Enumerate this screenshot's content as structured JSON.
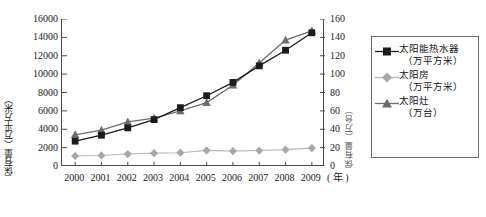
{
  "chart_data": {
    "type": "line",
    "title": "",
    "subtitle": "",
    "xlabel": "年",
    "ylabel": "保有量（万平方米）",
    "y2label": "保有量（万台）",
    "grid": false,
    "legend_position": "right",
    "categories": [
      "2000",
      "2001",
      "2002",
      "2003",
      "2004",
      "2005",
      "2006",
      "2007",
      "2008",
      "2009"
    ],
    "x": [
      2000,
      2001,
      2002,
      2003,
      2004,
      2005,
      2006,
      2007,
      2008,
      2009
    ],
    "ylim": [
      0,
      16000
    ],
    "yticks": [
      0,
      2000,
      4000,
      6000,
      8000,
      10000,
      12000,
      14000,
      16000
    ],
    "y2lim": [
      0,
      160
    ],
    "y2ticks": [
      0,
      20,
      40,
      60,
      80,
      100,
      120,
      140,
      160
    ],
    "series": [
      {
        "name": "太阳能热水器（万平方米）",
        "name_line1": "太阳能热水器",
        "name_line2": "（万平方米）",
        "axis": "left",
        "marker": "square",
        "color": "#1b1b1b",
        "values": [
          2700,
          3350,
          4150,
          5050,
          6350,
          7650,
          9100,
          10900,
          12600,
          14500
        ]
      },
      {
        "name": "太阳房（万平方米）",
        "name_line1": "太阳房",
        "name_line2": "（万平方米）",
        "axis": "left",
        "marker": "diamond",
        "color": "#a8a8a8",
        "values": [
          1100,
          1150,
          1300,
          1400,
          1450,
          1700,
          1620,
          1680,
          1780,
          1950
        ]
      },
      {
        "name": "太阳灶（万台）",
        "name_line1": "太阳灶",
        "name_line2": "（万台）",
        "axis": "right",
        "marker": "triangle",
        "color": "#6d6d6d",
        "values": [
          34,
          39,
          48,
          52,
          60,
          69,
          88,
          112,
          137,
          147
        ]
      }
    ]
  },
  "axes": {
    "left_title": "保有量（万平方米）",
    "right_title": "保有量（万台）",
    "x_unit": "( 年 )",
    "left_ticks": [
      "16000",
      "14000",
      "12000",
      "10000",
      "8000",
      "6000",
      "4000",
      "2000",
      "0"
    ],
    "right_ticks": [
      "160",
      "140",
      "120",
      "100",
      "80",
      "60",
      "40",
      "20",
      "0"
    ],
    "x_ticks": [
      "2000",
      "2001",
      "2002",
      "2003",
      "2004",
      "2005",
      "2006",
      "2007",
      "2008",
      "2009"
    ]
  },
  "legend": {
    "entries": [
      {
        "line1": "太阳能热水器",
        "line2": "（万平方米）",
        "marker": "square-marker-icon",
        "color": "#1b1b1b"
      },
      {
        "line1": "太阳房",
        "line2": "（万平方米）",
        "marker": "diamond-marker-icon",
        "color": "#a8a8a8"
      },
      {
        "line1": "太阳灶",
        "line2": "（万台）",
        "marker": "triangle-marker-icon",
        "color": "#6d6d6d"
      }
    ]
  },
  "colors": {
    "axis": "#4a4a4a",
    "series_water_heater": "#1b1b1b",
    "series_solar_house": "#a8a8a8",
    "series_solar_cooker": "#6d6d6d",
    "background": "#ffffff"
  }
}
